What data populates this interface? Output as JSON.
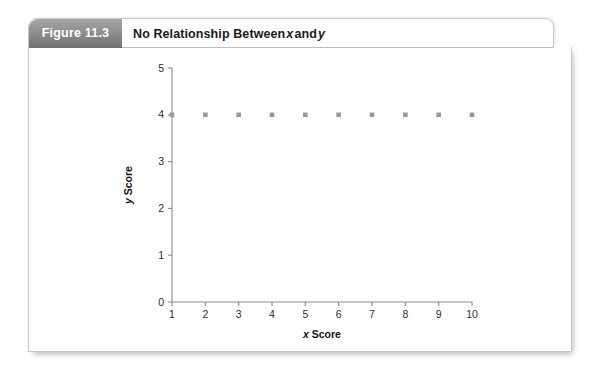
{
  "figure": {
    "tab_label": "Figure 11.3",
    "title_prefix": "No Relationship Between ",
    "title_var1": "x",
    "title_mid": " and ",
    "title_var2": "y"
  },
  "chart_data": {
    "type": "scatter",
    "title": "No Relationship Between x and y",
    "xlabel_var": "x",
    "xlabel_rest": " Score",
    "ylabel_var": "y",
    "ylabel_rest": " Score",
    "xlabel": "x Score",
    "ylabel": "y Score",
    "xlim": [
      1,
      10
    ],
    "ylim": [
      0,
      5
    ],
    "xticks": [
      1,
      2,
      3,
      4,
      5,
      6,
      7,
      8,
      9,
      10
    ],
    "yticks": [
      0,
      1,
      2,
      3,
      4,
      5
    ],
    "grid": false,
    "legend": null,
    "marker": "square",
    "marker_color": "#9a9a9a",
    "x": [
      1,
      2,
      3,
      4,
      5,
      6,
      7,
      8,
      9,
      10
    ],
    "y": [
      4,
      4,
      4,
      4,
      4,
      4,
      4,
      4,
      4,
      4
    ],
    "series": [
      {
        "name": "y",
        "points": [
          {
            "x": 1,
            "y": 4
          },
          {
            "x": 2,
            "y": 4
          },
          {
            "x": 3,
            "y": 4
          },
          {
            "x": 4,
            "y": 4
          },
          {
            "x": 5,
            "y": 4
          },
          {
            "x": 6,
            "y": 4
          },
          {
            "x": 7,
            "y": 4
          },
          {
            "x": 8,
            "y": 4
          },
          {
            "x": 9,
            "y": 4
          },
          {
            "x": 10,
            "y": 4
          }
        ]
      }
    ]
  }
}
